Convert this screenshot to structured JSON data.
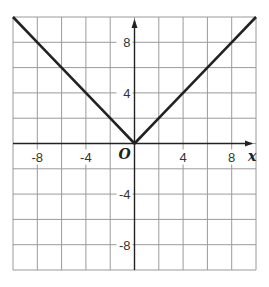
{
  "chart_data": {
    "type": "line",
    "title": "",
    "function": "y = |x|",
    "xlabel": "x",
    "ylabel": "",
    "origin_label": "O",
    "xlim": [
      -10,
      10
    ],
    "ylim": [
      -10,
      10
    ],
    "grid": true,
    "grid_step": 2,
    "x_ticks": [
      -8,
      -4,
      4,
      8
    ],
    "x_tick_labels": [
      "-8",
      "-4",
      "4",
      "8"
    ],
    "y_ticks": [
      8,
      4,
      -4,
      -8
    ],
    "y_tick_labels": [
      "8",
      "4",
      "-4",
      "-8"
    ],
    "series": [
      {
        "name": "y = |x|",
        "x": [
          -10,
          -8,
          -6,
          -4,
          -2,
          0,
          2,
          4,
          6,
          8,
          10
        ],
        "y": [
          10,
          8,
          6,
          4,
          2,
          0,
          2,
          4,
          6,
          8,
          10
        ]
      }
    ],
    "colors": {
      "line": "#222222",
      "grid": "#9a9a9a",
      "axis": "#222222"
    }
  }
}
